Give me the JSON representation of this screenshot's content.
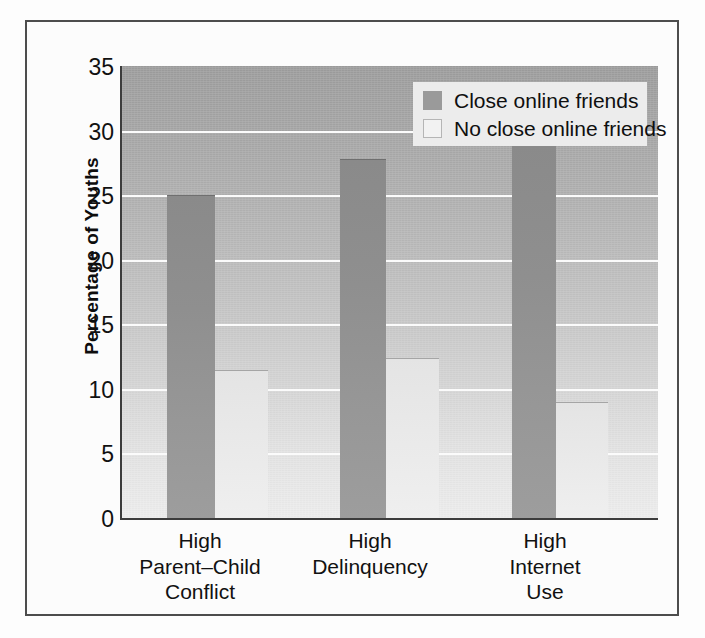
{
  "chart_data": {
    "type": "bar",
    "title": "",
    "subtitle": "",
    "xlabel": "",
    "ylabel": "Percentage of Youths",
    "ylim": [
      0,
      35
    ],
    "ytick_step": 5,
    "yticks": [
      "35",
      "30",
      "25",
      "20",
      "15",
      "10",
      "5",
      "0"
    ],
    "grid": true,
    "grid_orientation": "horizontal",
    "legend_position": "top-right",
    "categories": [
      "High\nParent–Child\nConflict",
      "High\nDelinquency",
      "High\nInternet\nUse"
    ],
    "category_lines": [
      [
        "High",
        "Parent–Child",
        "Conflict"
      ],
      [
        "High",
        "Delinquency"
      ],
      [
        "High",
        "Internet",
        "Use"
      ]
    ],
    "series": [
      {
        "name": "Close online friends",
        "color": "#9a9a9a",
        "values": [
          25.0,
          27.8,
          29.0
        ]
      },
      {
        "name": "No close online friends",
        "color": "#ededed",
        "values": [
          11.5,
          12.4,
          9.0
        ]
      }
    ]
  },
  "legend": {
    "items": [
      {
        "label": "Close online friends",
        "swatch": "dark"
      },
      {
        "label": "No close online friends",
        "swatch": "light"
      }
    ]
  },
  "axis": {
    "y_label": "Percentage of Youths"
  },
  "colors": {
    "frame_border": "#4d4d4d",
    "axis_line": "#3c3c3c",
    "gridline": "#fbfbfb",
    "bar_dark": "#9a9a9a",
    "bar_light": "#ededed",
    "legend_background": "#ececec",
    "text": "#111111"
  }
}
